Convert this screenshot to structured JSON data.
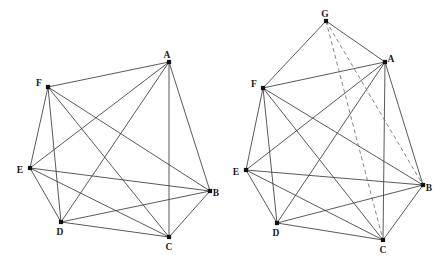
{
  "figure": {
    "title": "",
    "type": "graph-diagram",
    "width": 447,
    "height": 260,
    "background_color": "#ffffff",
    "edge_color": "#3c3c3c",
    "dashed_edge_color": "#6e6e6e",
    "node_color": "#111111",
    "label_color": "#1a1a1a"
  },
  "chart_data": {
    "type": "graph",
    "panels": [
      {
        "name": "left-graph",
        "caption": "",
        "node_count": 6,
        "edge_count": 15,
        "nodes": [
          {
            "id": "A",
            "label": "A",
            "x": 169,
            "y": 62,
            "label_dx": -2,
            "label_dy": -6
          },
          {
            "id": "B",
            "label": "B",
            "x": 210,
            "y": 191,
            "label_dx": 6,
            "label_dy": 3
          },
          {
            "id": "C",
            "label": "C",
            "x": 169,
            "y": 237,
            "label_dx": 0,
            "label_dy": 11
          },
          {
            "id": "D",
            "label": "D",
            "x": 61,
            "y": 222,
            "label_dx": -1,
            "label_dy": 11
          },
          {
            "id": "E",
            "label": "E",
            "x": 30,
            "y": 168,
            "label_dx": -10,
            "label_dy": 3
          },
          {
            "id": "F",
            "label": "F",
            "x": 48,
            "y": 87,
            "label_dx": -9,
            "label_dy": -3
          }
        ],
        "edges": [
          {
            "from": "A",
            "to": "B",
            "style": "solid"
          },
          {
            "from": "A",
            "to": "C",
            "style": "solid"
          },
          {
            "from": "A",
            "to": "D",
            "style": "solid"
          },
          {
            "from": "A",
            "to": "E",
            "style": "solid"
          },
          {
            "from": "A",
            "to": "F",
            "style": "solid"
          },
          {
            "from": "B",
            "to": "C",
            "style": "solid"
          },
          {
            "from": "B",
            "to": "D",
            "style": "solid"
          },
          {
            "from": "B",
            "to": "E",
            "style": "solid"
          },
          {
            "from": "B",
            "to": "F",
            "style": "solid"
          },
          {
            "from": "C",
            "to": "D",
            "style": "solid"
          },
          {
            "from": "C",
            "to": "E",
            "style": "solid"
          },
          {
            "from": "C",
            "to": "F",
            "style": "solid"
          },
          {
            "from": "D",
            "to": "E",
            "style": "solid"
          },
          {
            "from": "D",
            "to": "F",
            "style": "solid"
          },
          {
            "from": "E",
            "to": "F",
            "style": "solid"
          }
        ]
      },
      {
        "name": "right-graph",
        "caption": "",
        "node_count": 7,
        "edge_count": 19,
        "nodes": [
          {
            "id": "G",
            "label": "G",
            "x": 326,
            "y": 21,
            "label_dx": -1,
            "label_dy": -6
          },
          {
            "id": "A",
            "label": "A",
            "x": 385,
            "y": 62,
            "label_dx": 6,
            "label_dy": -2
          },
          {
            "id": "B",
            "label": "B",
            "x": 423,
            "y": 185,
            "label_dx": 6,
            "label_dy": 4
          },
          {
            "id": "C",
            "label": "C",
            "x": 383,
            "y": 240,
            "label_dx": 0,
            "label_dy": 11
          },
          {
            "id": "D",
            "label": "D",
            "x": 277,
            "y": 223,
            "label_dx": -1,
            "label_dy": 11
          },
          {
            "id": "E",
            "label": "E",
            "x": 246,
            "y": 170,
            "label_dx": -10,
            "label_dy": 3
          },
          {
            "id": "F",
            "label": "F",
            "x": 263,
            "y": 88,
            "label_dx": -9,
            "label_dy": -3
          }
        ],
        "edges": [
          {
            "from": "A",
            "to": "B",
            "style": "solid"
          },
          {
            "from": "A",
            "to": "C",
            "style": "solid"
          },
          {
            "from": "A",
            "to": "D",
            "style": "solid"
          },
          {
            "from": "A",
            "to": "E",
            "style": "solid"
          },
          {
            "from": "A",
            "to": "F",
            "style": "solid"
          },
          {
            "from": "B",
            "to": "C",
            "style": "solid"
          },
          {
            "from": "B",
            "to": "D",
            "style": "solid"
          },
          {
            "from": "B",
            "to": "E",
            "style": "solid"
          },
          {
            "from": "B",
            "to": "F",
            "style": "solid"
          },
          {
            "from": "C",
            "to": "D",
            "style": "solid"
          },
          {
            "from": "C",
            "to": "E",
            "style": "solid"
          },
          {
            "from": "C",
            "to": "F",
            "style": "solid"
          },
          {
            "from": "D",
            "to": "E",
            "style": "solid"
          },
          {
            "from": "D",
            "to": "F",
            "style": "solid"
          },
          {
            "from": "E",
            "to": "F",
            "style": "solid"
          },
          {
            "from": "G",
            "to": "F",
            "style": "solid"
          },
          {
            "from": "G",
            "to": "A",
            "style": "solid"
          },
          {
            "from": "G",
            "to": "B",
            "style": "dashed"
          },
          {
            "from": "G",
            "to": "C",
            "style": "dashed"
          }
        ]
      }
    ]
  }
}
